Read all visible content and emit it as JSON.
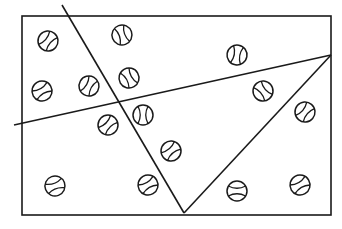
{
  "diagram": {
    "type": "geometry-partition",
    "stroke_color": "#1a1a1a",
    "background": "#ffffff",
    "rectangle": {
      "x": 22,
      "y": 16,
      "width": 309,
      "height": 199
    },
    "lines": [
      {
        "id": "diagonal-left",
        "x1": 62,
        "y1": 5,
        "x2": 184,
        "y2": 213
      },
      {
        "id": "crossing-line",
        "x1": 14,
        "y1": 125,
        "x2": 331,
        "y2": 55
      },
      {
        "id": "diagonal-right",
        "x1": 331,
        "y1": 55,
        "x2": 184,
        "y2": 213
      }
    ],
    "ball_radius": 10,
    "balls": [
      {
        "cx": 48,
        "cy": 41,
        "rot": 40
      },
      {
        "cx": 122,
        "cy": 35,
        "rot": -20
      },
      {
        "cx": 42,
        "cy": 91,
        "rot": 60
      },
      {
        "cx": 89,
        "cy": 86,
        "rot": 30
      },
      {
        "cx": 129,
        "cy": 78,
        "rot": -30
      },
      {
        "cx": 237,
        "cy": 55,
        "rot": 10
      },
      {
        "cx": 263,
        "cy": 91,
        "rot": -40
      },
      {
        "cx": 108,
        "cy": 125,
        "rot": 45
      },
      {
        "cx": 143,
        "cy": 115,
        "rot": 0
      },
      {
        "cx": 305,
        "cy": 112,
        "rot": 40
      },
      {
        "cx": 171,
        "cy": 151,
        "rot": 50
      },
      {
        "cx": 55,
        "cy": 186,
        "rot": 70
      },
      {
        "cx": 148,
        "cy": 185,
        "rot": 60
      },
      {
        "cx": 237,
        "cy": 191,
        "rot": 90
      },
      {
        "cx": 300,
        "cy": 185,
        "rot": 60
      }
    ],
    "ball_count": 15
  }
}
